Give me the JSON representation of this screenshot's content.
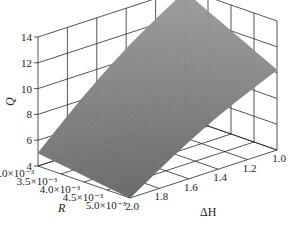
{
  "chart_data": {
    "type": "surface3d",
    "title": "",
    "zlabel": "Q",
    "xlabel": "R",
    "ylabel": "ΔH",
    "zlim": [
      4,
      14
    ],
    "z_ticks": [
      "4",
      "6",
      "8",
      "10",
      "12",
      "14"
    ],
    "r_ticks": [
      "3.0×10⁻³",
      "3.5×10⁻³",
      "4.0×10⁻³",
      "4.5×10⁻³",
      "5.0×10⁻³"
    ],
    "dh_ticks": [
      "2.0",
      "1.8",
      "1.6",
      "1.4",
      "1.2",
      "1.0"
    ],
    "r_range": [
      0.003,
      0.005
    ],
    "dh_range": [
      1.0,
      2.0
    ],
    "grid": true,
    "surface_color": "#8a8a8a",
    "surface_corners": [
      {
        "R": 0.003,
        "dH": 2.0,
        "Q": 5.0
      },
      {
        "R": 0.005,
        "dH": 2.0,
        "Q": 4.0
      },
      {
        "R": 0.005,
        "dH": 1.0,
        "Q": 10.2
      },
      {
        "R": 0.003,
        "dH": 1.0,
        "Q": 13.8
      }
    ]
  },
  "labels": {
    "q_axis": "Q",
    "r_axis": "R",
    "dh_axis": "ΔH"
  }
}
